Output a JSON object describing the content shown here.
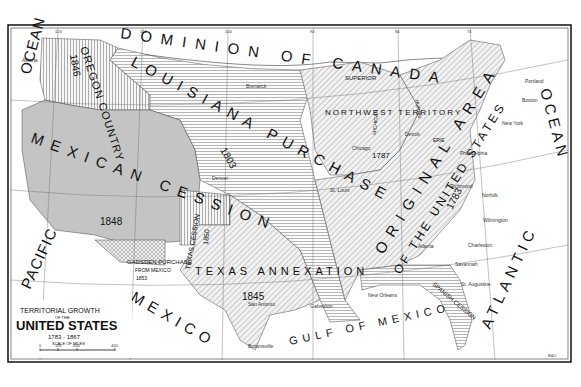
{
  "map": {
    "title_line1": "TERRITORIAL GROWTH",
    "title_line2": "OF THE",
    "title_line3": "UNITED STATES",
    "title_years": "1783 - 1867",
    "scale_label": "SCALE OF MILES",
    "scale_ticks": [
      "0",
      "100",
      "200",
      "400"
    ],
    "credit": "B&Ll",
    "longitude_ticks": [
      "124",
      "114",
      "104",
      "94",
      "84",
      "74"
    ],
    "water_labels": {
      "pacific": "PACIFIC",
      "ocean_west": "OCEAN",
      "atlantic": "ATLANTIC",
      "ocean_east": "OCEAN",
      "gulf": "GULF OF MEXICO",
      "canada": "DOMINION OF CANADA",
      "mexico": "MEXICO"
    },
    "regions": [
      {
        "id": "original",
        "name": "ORIGINAL AREA",
        "sub": "OF THE UNITED STATES",
        "year": "1783",
        "pattern": "diagonal"
      },
      {
        "id": "northwest",
        "name": "NORTHWEST TERRITORY",
        "year": "1787",
        "pattern": "diagonal"
      },
      {
        "id": "louisiana",
        "name": "LOUISIANA PURCHASE",
        "year": "1803",
        "pattern": "horizontal"
      },
      {
        "id": "oregon",
        "name": "OREGON COUNTRY",
        "year": "1846",
        "pattern": "vertical",
        "note": "DISCOVERY EXPLORATION TREATY WITH GREAT BRITAIN"
      },
      {
        "id": "mexican",
        "name": "MEXICAN CESSION",
        "year": "1848",
        "pattern": "horizontal-dense"
      },
      {
        "id": "texas",
        "name": "TEXAS ANNEXATION",
        "year": "1845",
        "pattern": "diagonal"
      },
      {
        "id": "texas_cession",
        "name": "TEXAS CESSION",
        "year": "1850",
        "pattern": "vertical"
      },
      {
        "id": "gadsden",
        "name": "GADSDEN PURCHASE",
        "sub": "FROM MEXICO",
        "year": "1853",
        "pattern": "crosshatch"
      },
      {
        "id": "spanish",
        "name": "SPANISH CESSION",
        "year": "1819",
        "pattern": "horizontal"
      }
    ],
    "lakes": [
      "SUPERIOR",
      "MICHIGAN",
      "HURON",
      "ERIE"
    ],
    "cities": [
      "Astoria",
      "Bismarck",
      "Denver",
      "St. Louis",
      "Chicago",
      "Detroit",
      "Philadelphia",
      "New York",
      "Boston",
      "Portland",
      "Richmond",
      "Norfolk",
      "Wilmington",
      "Charleston",
      "Savannah",
      "St. Augustine",
      "Atlanta",
      "New Orleans",
      "Galveston",
      "San Antonio",
      "Brownsville",
      "Albany",
      "Quebec",
      "Pittsburgh",
      "Vicksburg",
      "Milwaukee"
    ]
  }
}
